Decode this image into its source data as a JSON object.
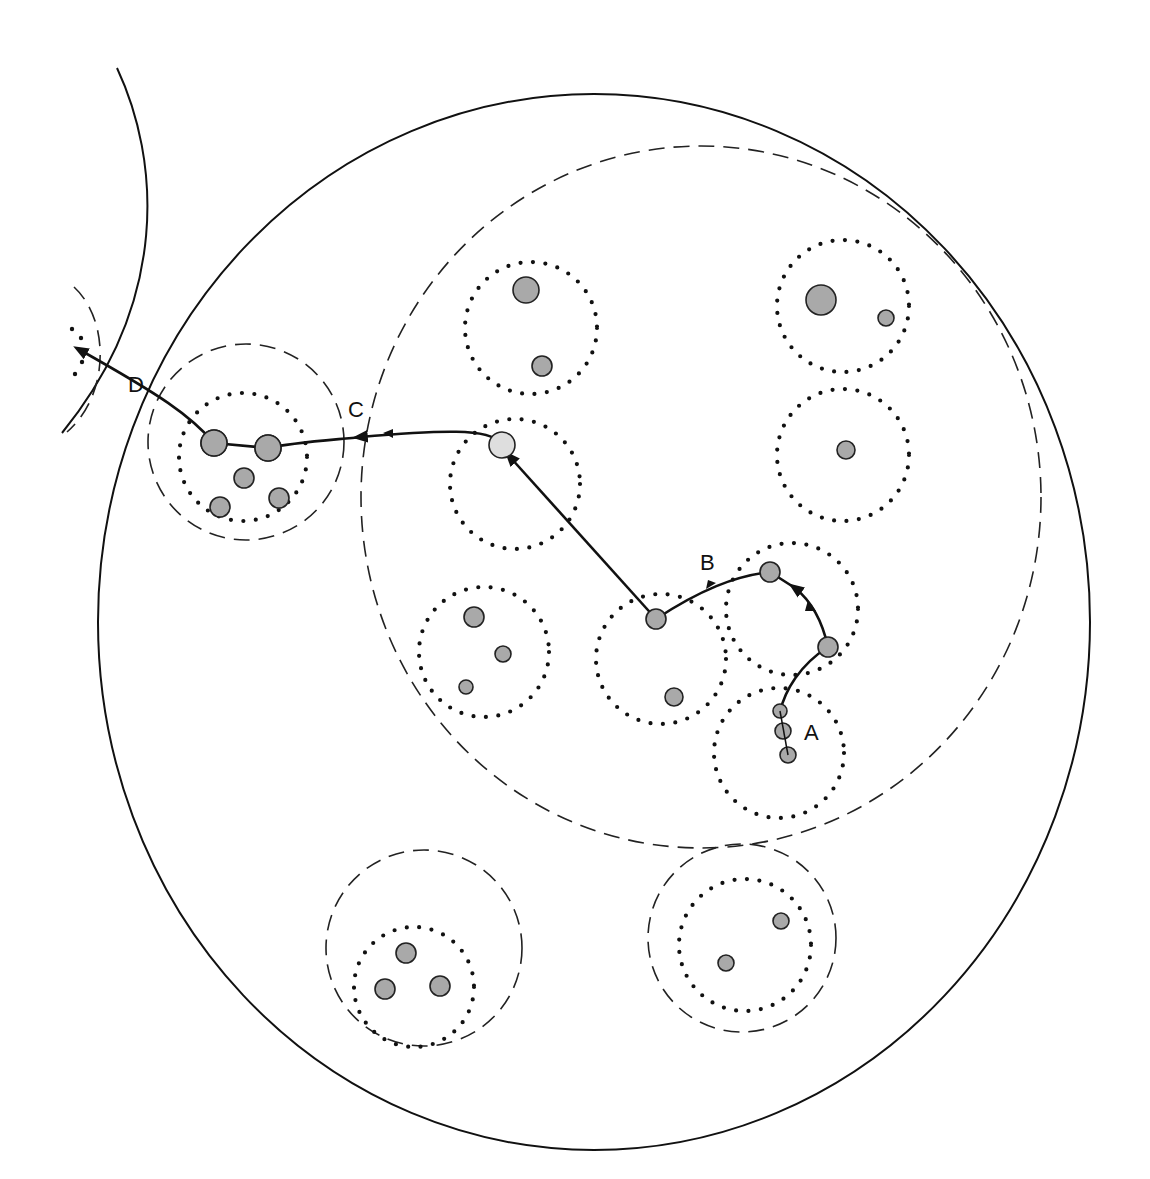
{
  "diagram": {
    "type": "nested-circle migration diagram",
    "labels": {
      "A": "A",
      "B": "B",
      "C": "C",
      "D": "D"
    },
    "legend": {
      "solid_circle": "outer boundary",
      "dashed_circle": "group boundary",
      "dotted_circle": "cluster",
      "filled_dot": "member",
      "light_dot": "intermediate position"
    },
    "colors": {
      "line": "#111111",
      "member_fill": "#a9a9a9",
      "light_fill": "#dedede",
      "background": "#ffffff"
    },
    "path_sequence": [
      "A",
      "B",
      "C",
      "D"
    ]
  }
}
